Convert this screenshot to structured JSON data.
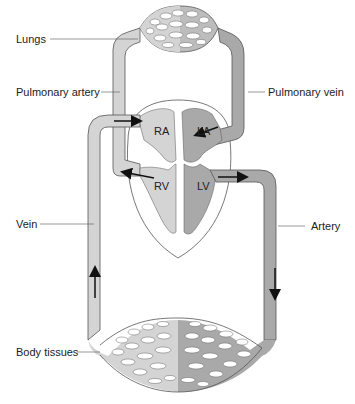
{
  "labels": {
    "lungs": "Lungs",
    "pulmonary_artery": "Pulmonary artery",
    "pulmonary_vein": "Pulmonary vein",
    "vein": "Vein",
    "artery": "Artery",
    "body_tissues": "Body tissues"
  },
  "chambers": {
    "ra": "RA",
    "la": "LA",
    "rv": "RV",
    "lv": "LV"
  },
  "colors": {
    "deoxygenated": "#d4d4d4",
    "oxygenated": "#a9a9a9",
    "outline": "#555555",
    "text": "#222222"
  }
}
